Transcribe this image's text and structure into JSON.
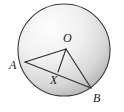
{
  "figure": {
    "kind": "circle-geometry-diagram",
    "canvas": {
      "width": 124,
      "height": 112,
      "background": "#ffffff"
    },
    "circle": {
      "name": "circle-outline",
      "cx": 64,
      "cy": 50,
      "r": 46,
      "stroke_color": "#3a3a3a",
      "stroke_width": 1.1,
      "fill_light": "#fdfdfd",
      "fill_mid": "#e3e3e3",
      "fill_dark": "#a8a8a8",
      "gradient_focus_x": 0.34,
      "gradient_focus_y": 0.26
    },
    "points": [
      {
        "id": "O",
        "label": "O",
        "x": 66,
        "y": 49,
        "label_x": 63,
        "label_y": 42,
        "on_circle": false,
        "marked": false
      },
      {
        "id": "A",
        "label": "A",
        "x": 25,
        "y": 62,
        "label_x": 9,
        "label_y": 69,
        "on_circle": true,
        "marked": false
      },
      {
        "id": "B",
        "label": "B",
        "x": 91,
        "y": 88,
        "label_x": 93,
        "label_y": 102,
        "on_circle": true,
        "marked": false
      },
      {
        "id": "X",
        "label": "X",
        "x": 58,
        "y": 72,
        "label_x": 50,
        "label_y": 84,
        "on_circle": false,
        "marked": false
      }
    ],
    "segments": [
      {
        "id": "OA",
        "from": "O",
        "to": "A",
        "x1": 66,
        "y1": 49,
        "x2": 25,
        "y2": 62
      },
      {
        "id": "OB",
        "from": "O",
        "to": "B",
        "x1": 66,
        "y1": 49,
        "x2": 91,
        "y2": 88
      },
      {
        "id": "OX",
        "from": "O",
        "to": "X",
        "x1": 66,
        "y1": 49,
        "x2": 58,
        "y2": 72
      },
      {
        "id": "AB",
        "from": "A",
        "to": "B",
        "x1": 25,
        "y1": 62,
        "x2": 91,
        "y2": 88
      }
    ],
    "segment_style": {
      "stroke_color": "#2b2b2b",
      "stroke_width": 1.1
    }
  }
}
